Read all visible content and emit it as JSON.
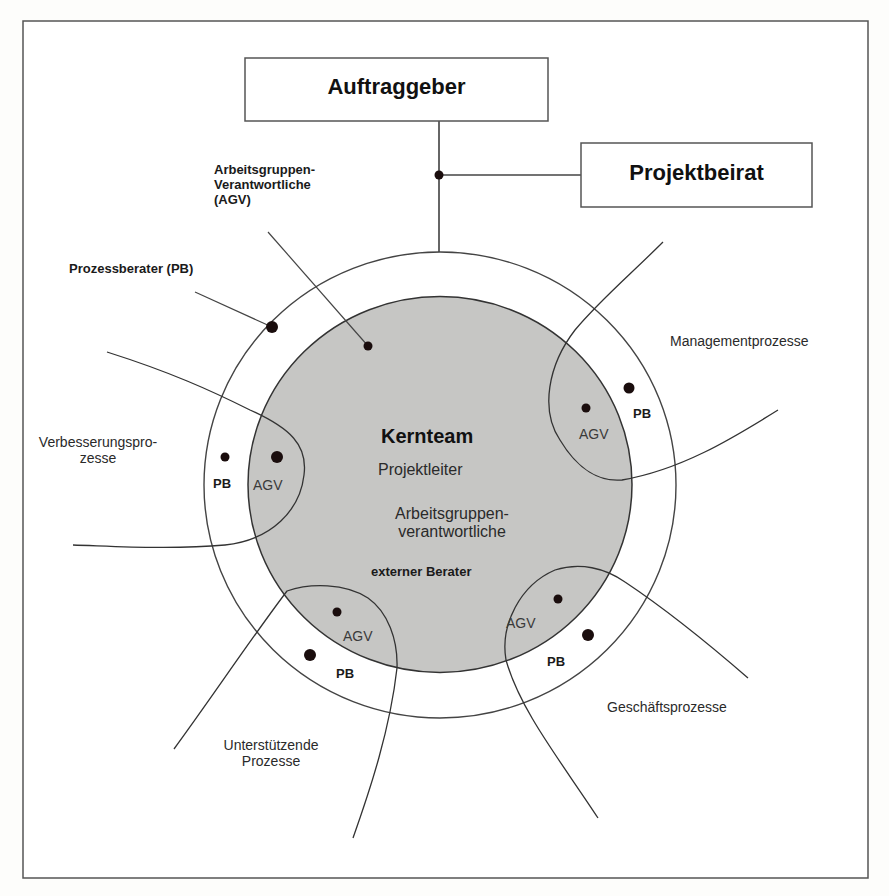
{
  "diagram": {
    "colors": {
      "background": "#fdfdfb",
      "line": "#444444",
      "core_fill": "#c6c6c4",
      "ring_fill": "#ffffff",
      "dot": "#1a0d0d"
    },
    "boxes": {
      "client": "Auftraggeber",
      "advisory_board": "Projektbeirat"
    },
    "callouts": {
      "agv": [
        "Arbeitsgruppen-",
        "Verantwortliche",
        "(AGV)"
      ],
      "pb": "Prozessberater (PB)"
    },
    "core_team": {
      "title": "Kernteam",
      "members": [
        "Projektleiter",
        "Arbeitsgruppen-",
        "verantwortliche"
      ],
      "external": "externer Berater"
    },
    "processes": [
      {
        "name": "Managementprozesse",
        "lines": [
          "Managementprozesse"
        ],
        "agv": "AGV",
        "pb": "PB"
      },
      {
        "name": "Verbesserungsprozesse",
        "lines": [
          "Verbesserungspro-",
          "zesse"
        ],
        "agv": "AGV",
        "pb": "PB"
      },
      {
        "name": "Unterstützende Prozesse",
        "lines": [
          "Unterstützende",
          "Prozesse"
        ],
        "agv": "AGV",
        "pb": "PB"
      },
      {
        "name": "Geschäftsprozesse",
        "lines": [
          "Geschäftsprozesse"
        ],
        "agv": "AGV",
        "pb": "PB"
      }
    ]
  }
}
